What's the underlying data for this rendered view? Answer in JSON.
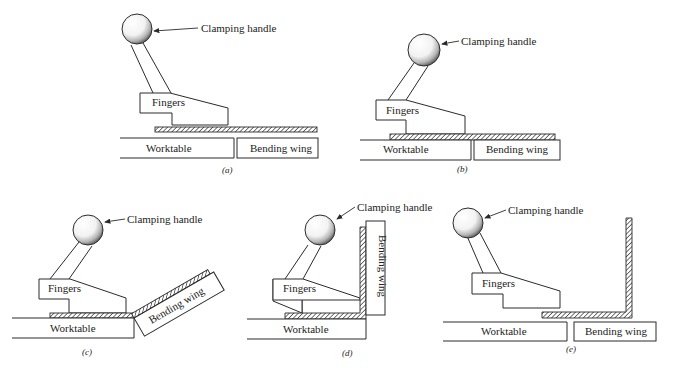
{
  "figure": {
    "labels": {
      "clamping_handle": "Clamping handle",
      "fingers": "Fingers",
      "worktable": "Worktable",
      "bending_wing": "Bending wing"
    },
    "panels": [
      {
        "id": "a",
        "caption": "(a)",
        "description": "Sheet placed on worktable, clamp fingers raised"
      },
      {
        "id": "b",
        "caption": "(b)",
        "description": "Fingers clamp sheet against worktable"
      },
      {
        "id": "c",
        "caption": "(c)",
        "description": "Bending wing rotates up, bending the sheet"
      },
      {
        "id": "d",
        "caption": "(d)",
        "description": "Bending wing vertical, sheet bent 90 degrees"
      },
      {
        "id": "e",
        "caption": "(e)",
        "description": "Fingers released, bending wing returned, bent part removed"
      }
    ]
  },
  "colors": {
    "line": "#2a2a2a",
    "background": "#ffffff",
    "ball_shading": "#555555"
  }
}
